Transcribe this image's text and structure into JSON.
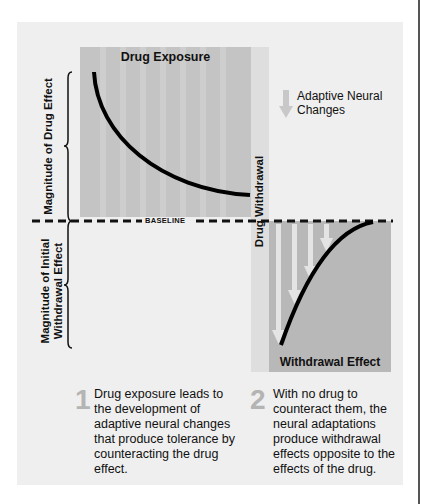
{
  "diagram": {
    "panels": {
      "exposure": {
        "title": "Drug Exposure",
        "color": "#c4c4c4"
      },
      "withdrawal_strip": {
        "label": "Drug Withdrawal",
        "color": "#dedede"
      },
      "withdrawal": {
        "title": "Withdrawal Effect",
        "color": "#b8b8b8"
      }
    },
    "axis_labels": {
      "upper": "Magnitude of Drug Effect",
      "lower_line1": "Magnitude of Initial",
      "lower_line2": "Withdrawal Effect"
    },
    "baseline_label": "BASELINE",
    "legend": {
      "icon": "down-arrow-icon",
      "line1": "Adaptive Neural",
      "line2": "Changes"
    },
    "notes": [
      {
        "number": "1",
        "text": "Drug exposure leads to the development of adaptive neural changes that produce tolerance by counteracting the drug effect."
      },
      {
        "number": "2",
        "text": "With no drug to counteract them, the neural adaptations produce withdrawal effects opposite to the effects of the drug."
      }
    ],
    "colors": {
      "background": "#efefef",
      "curve": "#000000",
      "arrow": "#e4e4e4",
      "numeral": "#b4b4b4"
    }
  }
}
